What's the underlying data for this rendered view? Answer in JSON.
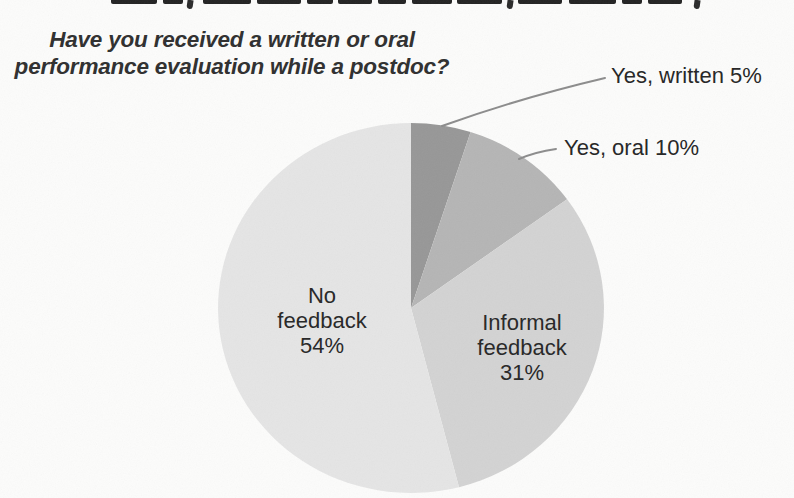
{
  "page": {
    "background": "#fcfcfb",
    "top_line_cropped": true
  },
  "chart_data": {
    "type": "pie",
    "title": "Have you received a written or oral performance evaluation while a postdoc?",
    "title_lines": [
      "Have you received a written or oral",
      "performance evaluation while a postdoc?"
    ],
    "categories": [
      "Yes, written",
      "Yes, oral",
      "Informal feedback",
      "No feedback"
    ],
    "values": [
      5,
      10,
      31,
      54
    ],
    "unit": "%",
    "start_angle_deg": 0,
    "direction": "clockwise",
    "legend": "none",
    "label_style": "outside callouts for small slices, inside labels for large slices",
    "leader_line_color": "#8c8c8c",
    "text_color": "#262626",
    "slices": [
      {
        "name": "Yes, written",
        "pct": 5,
        "color": "#979797",
        "callout": "Yes, written 5%"
      },
      {
        "name": "Yes, oral",
        "pct": 10,
        "color": "#b5b5b5",
        "callout": "Yes, oral 10%"
      },
      {
        "name": "Informal feedback",
        "pct": 31,
        "color": "#d3d3d3",
        "inside_lines": [
          "Informal",
          "feedback",
          "31%"
        ]
      },
      {
        "name": "No feedback",
        "pct": 54,
        "color": "#e5e5e5",
        "inside_lines": [
          "No",
          "feedback",
          "54%"
        ]
      }
    ]
  }
}
